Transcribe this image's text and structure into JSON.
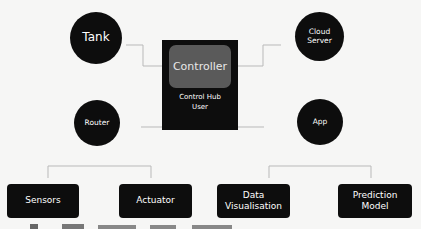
{
  "diagram": {
    "nodes": {
      "tank": {
        "label": "Tank"
      },
      "router": {
        "label": "Router"
      },
      "cloud_server": {
        "line1": "Cloud",
        "line2": "Server"
      },
      "app": {
        "label": "App"
      },
      "controller": {
        "title": "Controller",
        "caption_line1": "Control Hub",
        "caption_line2": "User"
      },
      "sensors": {
        "label": "Sensors"
      },
      "actuator": {
        "label": "Actuator"
      },
      "data_visualisation": {
        "line1": "Data",
        "line2": "Visualisation"
      },
      "prediction_model": {
        "line1": "Prediction",
        "line2": "Model"
      }
    },
    "colors": {
      "node_fill": "#0d0d0d",
      "inner_box": "#5a5a5a",
      "connector": "#b9b9b9",
      "background": "#f6f6f5",
      "text": "#ffffff"
    }
  }
}
